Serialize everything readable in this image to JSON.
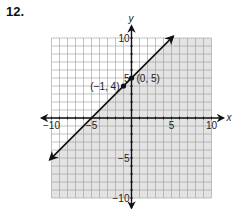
{
  "problem": {
    "number": "12."
  },
  "chart_data": {
    "type": "line",
    "title": "",
    "xlabel": "x",
    "ylabel": "y",
    "xlim": [
      -10,
      10
    ],
    "ylim": [
      -10,
      10
    ],
    "grid": true,
    "grid_step": 1,
    "x_ticks": [
      "-10",
      "-5",
      "5",
      "10"
    ],
    "y_ticks": [
      "10",
      "5",
      "-5",
      "-10"
    ],
    "x_tick_labels": [
      "−10",
      "−5",
      "5",
      "10"
    ],
    "y_tick_labels": [
      "10",
      "5",
      "−5",
      "−10"
    ],
    "series": [
      {
        "name": "boundary line y = x + 5",
        "style": "solid",
        "arrows": "both",
        "x": [
          -10,
          5
        ],
        "y": [
          -5,
          10
        ]
      }
    ],
    "points": [
      {
        "x": -1,
        "y": 4,
        "label": "(−1, 4)"
      },
      {
        "x": 0,
        "y": 5,
        "label": "(0, 5)"
      }
    ],
    "shaded_region": "below line (y ≤ x + 5)",
    "colors": {
      "shade": "#e3e3e3",
      "grid": "#9a9a9a",
      "unshaded_bg": "#ffffff",
      "axis": "#111111"
    }
  }
}
